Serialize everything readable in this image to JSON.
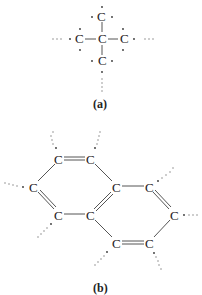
{
  "panels": [
    {
      "label": "(a)",
      "description": "tetrahedral carbon with four carbon neighbors",
      "atoms": [
        {
          "symbol": "C",
          "x": 101,
          "y": 17
        },
        {
          "symbol": "C",
          "x": 79,
          "y": 39
        },
        {
          "symbol": "C",
          "x": 102,
          "y": 39
        },
        {
          "symbol": "C",
          "x": 124,
          "y": 39
        },
        {
          "symbol": "C",
          "x": 102,
          "y": 61
        }
      ]
    },
    {
      "label": "(b)",
      "description": "fused two-ring carbon network",
      "atoms": [
        {
          "symbol": "C",
          "x": 58,
          "y": 159
        },
        {
          "symbol": "C",
          "x": 90,
          "y": 159
        },
        {
          "symbol": "C",
          "x": 33,
          "y": 187
        },
        {
          "symbol": "C",
          "x": 116,
          "y": 187
        },
        {
          "symbol": "C",
          "x": 149,
          "y": 187
        },
        {
          "symbol": "C",
          "x": 58,
          "y": 215
        },
        {
          "symbol": "C",
          "x": 90,
          "y": 215
        },
        {
          "symbol": "C",
          "x": 174,
          "y": 215
        },
        {
          "symbol": "C",
          "x": 116,
          "y": 243
        },
        {
          "symbol": "C",
          "x": 149,
          "y": 243
        }
      ]
    }
  ],
  "labels": {
    "a": "(a)",
    "b": "(b)"
  },
  "atom_symbol": "C",
  "colors": {
    "text": "#222222",
    "bond": "#555555",
    "background": "#ffffff"
  }
}
